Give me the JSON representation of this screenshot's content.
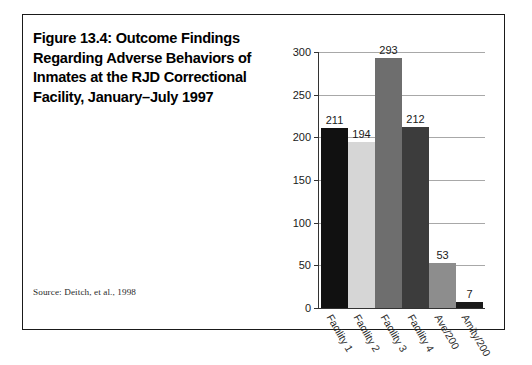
{
  "figure": {
    "title": "Figure 13.4: Outcome Findings\nRegarding Adverse Behaviors of\nInmates at the RJD Correctional\nFacility, January–July 1997",
    "source": "Source: Deitch, et al., 1998",
    "border_color": "#1a1a1a"
  },
  "chart_data": {
    "type": "bar",
    "title": "Figure 13.4: Outcome Findings Regarding Adverse Behaviors of Inmates at the RJD Correctional Facility, January–July 1997",
    "xlabel": "",
    "ylabel": "",
    "ylim": [
      0,
      300
    ],
    "yticks": [
      0,
      50,
      100,
      150,
      200,
      250,
      300
    ],
    "grid": true,
    "legend": false,
    "categories": [
      "Facility 1",
      "Facility 2",
      "Facility 3",
      "Facility 4",
      "Ave/200",
      "Amity/200"
    ],
    "values": [
      211,
      194,
      293,
      212,
      53,
      7
    ],
    "bar_colors": [
      "#111111",
      "#d6d6d6",
      "#6e6e6e",
      "#3c3c3c",
      "#8d8d8d",
      "#1a1a1a"
    ],
    "source": "Source: Deitch, et al., 1998"
  },
  "axis": {
    "gridline_color": "#a8a8a8",
    "axis_color": "#333333"
  }
}
